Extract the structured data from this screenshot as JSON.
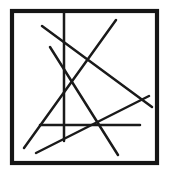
{
  "figure": {
    "title": "Square frame with six intersecting straight lines",
    "background_color": "#ffffff",
    "ink_color": "#1a1a1a",
    "frame_color": "#151515",
    "width": 169,
    "height": 178,
    "style": "hand-drawn black ink line figure"
  },
  "chart_data": {
    "type": "line",
    "title": "Square frame with six intersecting straight lines",
    "xlabel": "",
    "ylabel": "",
    "xlim": [
      0,
      169
    ],
    "ylim": [
      0,
      178
    ],
    "grid": false,
    "legend": "none",
    "frame": {
      "name": "outer-square-border",
      "x": 12,
      "y": 11,
      "width": 145,
      "height": 152,
      "stroke_width": 4.2,
      "color": "#151515"
    },
    "series": [
      {
        "name": "vertical-line",
        "orientation": "vertical",
        "x1": 64,
        "y1": 13,
        "x2": 64,
        "y2": 141,
        "color": "#1a1a1a"
      },
      {
        "name": "horizontal-line",
        "orientation": "horizontal",
        "x1": 40,
        "y1": 125,
        "x2": 140,
        "y2": 125,
        "color": "#1a1a1a"
      },
      {
        "name": "diagonal-down-right-long",
        "orientation": "descending",
        "x1": 42,
        "y1": 26,
        "x2": 152,
        "y2": 107,
        "color": "#1a1a1a"
      },
      {
        "name": "diagonal-up-right-long",
        "orientation": "ascending",
        "x1": 24,
        "y1": 148,
        "x2": 116,
        "y2": 20,
        "color": "#1a1a1a"
      },
      {
        "name": "diagonal-steep-down-right",
        "orientation": "descending",
        "x1": 50,
        "y1": 47,
        "x2": 118,
        "y2": 155,
        "color": "#1a1a1a"
      },
      {
        "name": "diagonal-shallow-up-right",
        "orientation": "ascending",
        "x1": 36,
        "y1": 153,
        "x2": 149,
        "y2": 96,
        "color": "#1a1a1a"
      }
    ],
    "line_count": 6,
    "intersection_notes": "Lines cross forming an X near the right-center and a dense node near the lower-left of the horizontal line."
  }
}
